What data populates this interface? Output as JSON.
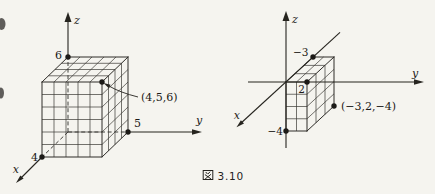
{
  "caption": {
    "full": "図 3.10",
    "prefix": "図",
    "number": "3.10"
  },
  "left_figure": {
    "axis_x_label": "x",
    "axis_y_label": "y",
    "axis_z_label": "z",
    "tick_x": "4",
    "tick_y": "5",
    "tick_z": "6",
    "point_label": "(4,5,6)"
  },
  "right_figure": {
    "axis_x_label": "x",
    "axis_y_label": "y",
    "axis_z_label": "z",
    "tick_x": "−3",
    "tick_y": "2",
    "tick_z": "−4",
    "point_label": "(−3,2,−4)"
  }
}
